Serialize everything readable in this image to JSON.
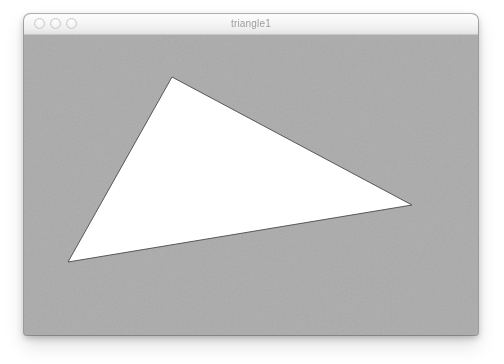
{
  "window": {
    "title": "triangle1",
    "controls": [
      {
        "name": "close-button",
        "label": ""
      },
      {
        "name": "minimize-button",
        "label": ""
      },
      {
        "name": "maximize-button",
        "label": ""
      }
    ]
  },
  "canvas": {
    "background_color": "#a9a9a9",
    "width": 454,
    "height": 300,
    "texture": "noise-grain"
  },
  "shape": {
    "type": "triangle",
    "fill_color": "#ffffff",
    "stroke_color": "#4a4a4a",
    "stroke_width": 0.9,
    "vertices": [
      {
        "label": "apex",
        "x": 148,
        "y": 42
      },
      {
        "label": "bottom-left",
        "x": 44,
        "y": 227
      },
      {
        "label": "right",
        "x": 388,
        "y": 170
      }
    ],
    "points_attr": "148,42 44,227 388,170"
  }
}
